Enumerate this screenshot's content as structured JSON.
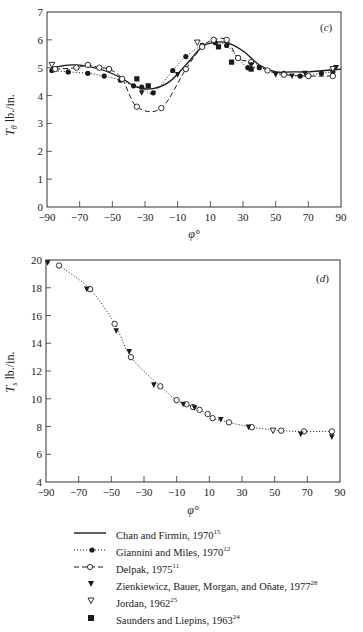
{
  "chart_data": [
    {
      "panel": "(c)",
      "type": "line",
      "xlabel": "φ°",
      "ylabel": "Tθ lb./in.",
      "xlim": [
        -90,
        90
      ],
      "ylim": [
        0,
        7
      ],
      "xticks": [
        -90,
        -70,
        -50,
        -30,
        -10,
        10,
        30,
        50,
        70,
        90
      ],
      "yticks": [
        0,
        1,
        2,
        3,
        4,
        5,
        6,
        7
      ],
      "grid": false,
      "series": [
        {
          "name": "Chan and Firmin, 1970",
          "style": "solid",
          "x": [
            -87,
            -75,
            -65,
            -55,
            -45,
            -35,
            -25,
            -15,
            -5,
            5,
            12,
            20,
            30,
            40,
            50,
            60,
            70,
            80,
            90
          ],
          "y": [
            5.0,
            5.1,
            5.05,
            4.9,
            4.65,
            4.3,
            4.25,
            4.5,
            5.1,
            5.75,
            5.9,
            5.9,
            5.6,
            5.1,
            4.85,
            4.85,
            4.85,
            4.9,
            4.95
          ]
        },
        {
          "name": "Giannini and Miles, 1970",
          "style": "dotted-filled-circle",
          "x": [
            -87,
            -77,
            -65,
            -55,
            -45,
            -37,
            -32,
            -25,
            -13,
            -5,
            5,
            13,
            20,
            27,
            33,
            40,
            55,
            65,
            78,
            85
          ],
          "y": [
            4.9,
            4.85,
            4.8,
            4.7,
            4.55,
            4.35,
            4.3,
            4.1,
            4.9,
            5.4,
            5.8,
            5.9,
            5.8,
            5.35,
            5.0,
            5.0,
            4.8,
            4.7,
            4.8,
            4.85
          ]
        },
        {
          "name": "Delpak, 1975",
          "style": "dashed-open-circle",
          "x": [
            -85,
            -72,
            -65,
            -58,
            -52,
            -44,
            -35,
            -20,
            -5,
            5,
            12,
            20,
            27,
            35,
            45,
            55,
            70,
            85
          ],
          "y": [
            4.95,
            5.0,
            5.1,
            5.0,
            4.95,
            4.6,
            3.6,
            3.55,
            4.95,
            5.75,
            6.0,
            6.0,
            5.35,
            5.2,
            4.9,
            4.75,
            4.7,
            4.7
          ]
        },
        {
          "name": "Zienkiewicz, Bauer, Morgan, and Oñate, 1977",
          "style": "filled-triangle-down",
          "x": [
            -32,
            -10,
            35,
            50,
            60,
            68,
            87
          ],
          "y": [
            4.1,
            4.75,
            5.1,
            4.75,
            4.7,
            4.8,
            5.0
          ]
        },
        {
          "name": "Jordan, 1962",
          "style": "open-triangle-down",
          "x": [
            -87,
            2,
            85
          ],
          "y": [
            5.1,
            5.9,
            4.95
          ]
        },
        {
          "name": "Saunders and Liepins, 1963",
          "style": "filled-square",
          "x": [
            -35,
            -28,
            15,
            23,
            35
          ],
          "y": [
            4.6,
            4.35,
            5.75,
            5.2,
            4.95
          ]
        }
      ]
    },
    {
      "panel": "(d)",
      "type": "line",
      "xlabel": "φ°",
      "ylabel": "Ts lb./in.",
      "xlim": [
        -90,
        90
      ],
      "ylim": [
        4,
        20
      ],
      "xticks": [
        -90,
        -70,
        -50,
        -30,
        -10,
        10,
        30,
        50,
        70,
        90
      ],
      "yticks": [
        4,
        6,
        8,
        10,
        12,
        14,
        16,
        18,
        20
      ],
      "grid": false,
      "series": [
        {
          "name": "Delpak, 1975",
          "style": "dotted-open-circle",
          "x": [
            -82,
            -63,
            -48,
            -38,
            -20,
            -10,
            -4,
            0,
            4,
            9,
            12,
            22,
            36,
            54,
            68,
            85
          ],
          "y": [
            19.6,
            17.9,
            15.4,
            13.0,
            10.9,
            9.9,
            9.6,
            9.4,
            9.2,
            8.9,
            8.6,
            8.3,
            7.95,
            7.7,
            7.65,
            7.65
          ]
        },
        {
          "name": "Zienkiewicz, Bauer, Morgan, and Oñate, 1977",
          "style": "filled-triangle-down",
          "x": [
            -89,
            -65,
            -47,
            -39,
            -24,
            -6,
            1,
            17,
            34,
            66,
            85
          ],
          "y": [
            19.8,
            17.9,
            14.9,
            13.4,
            11.0,
            9.6,
            9.35,
            8.5,
            7.95,
            7.45,
            7.25
          ]
        },
        {
          "name": "Jordan, 1962",
          "style": "open-triangle-down",
          "x": [
            49
          ],
          "y": [
            7.7
          ]
        }
      ]
    }
  ],
  "charts": {
    "c": {
      "panel_label": "(c)",
      "ylabel_main": "T",
      "ylabel_sub": "θ",
      "ylabel_rest": " lb./in.",
      "xlabel": "φ°",
      "xtick_labels": [
        "−90",
        "−70",
        "−50",
        "−30",
        "−10",
        "10",
        "30",
        "50",
        "70",
        "90"
      ],
      "ytick_labels": [
        "0",
        "1",
        "2",
        "3",
        "4",
        "5",
        "6",
        "7"
      ]
    },
    "d": {
      "panel_label": "(d)",
      "ylabel_main": "T",
      "ylabel_sub": "s",
      "ylabel_rest": " lb./in.",
      "xlabel": "φ°",
      "xtick_labels": [
        "−90",
        "−70",
        "−50",
        "−30",
        "−10",
        "10",
        "30",
        "50",
        "70",
        "90"
      ],
      "ytick_labels": [
        "4",
        "6",
        "8",
        "10",
        "12",
        "14",
        "16",
        "18",
        "20"
      ]
    }
  },
  "legend": {
    "items": [
      {
        "label": "Chan and Firmin, 1970",
        "ref": "15",
        "symbol": "solid-line"
      },
      {
        "label": "Giannini and Miles, 1970",
        "ref": "12",
        "symbol": "dotted-filled-circle"
      },
      {
        "label": "Delpak, 1975",
        "ref": "11",
        "symbol": "dashed-open-circle"
      },
      {
        "label": "Zienkiewicz, Bauer, Morgan, and Oñate, 1977",
        "ref": "28",
        "symbol": "filled-triangle-down"
      },
      {
        "label": "Jordan, 1962",
        "ref": "25",
        "symbol": "open-triangle-down"
      },
      {
        "label": "Saunders and Liepins, 1963",
        "ref": "24",
        "symbol": "filled-square"
      }
    ]
  },
  "colors": {
    "ink": "#1a1a1a",
    "axis": "#333333",
    "background": "#ffffff"
  }
}
